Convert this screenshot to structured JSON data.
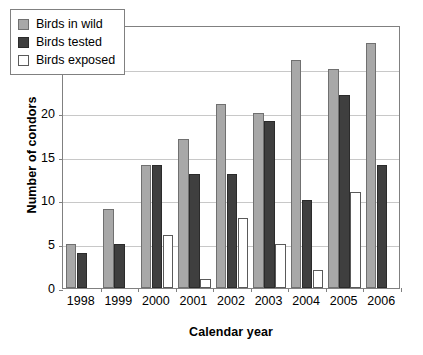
{
  "chart_data": {
    "type": "bar",
    "title": "",
    "xlabel": "Calendar year",
    "ylabel": "Number of condors",
    "categories": [
      "1998",
      "1999",
      "2000",
      "2001",
      "2002",
      "2003",
      "2004",
      "2005",
      "2006"
    ],
    "series": [
      {
        "name": "Birds in wild",
        "color": "#a8a8a8",
        "values": [
          5,
          9,
          14,
          17,
          21,
          20,
          26,
          25,
          28
        ]
      },
      {
        "name": "Birds tested",
        "color": "#3f3f3f",
        "values": [
          4,
          5,
          14,
          13,
          13,
          19,
          10,
          22,
          14
        ]
      },
      {
        "name": "Birds exposed",
        "color": "#ffffff",
        "values": [
          0,
          0,
          6,
          1,
          8,
          5,
          2,
          11,
          0
        ]
      }
    ],
    "ylim": [
      0,
      30
    ],
    "yticks": [
      0,
      5,
      10,
      15,
      20,
      25,
      30
    ],
    "ytick_labels": [
      "0",
      "5",
      "10",
      "15",
      "20",
      "25",
      "30"
    ],
    "grid": true,
    "legend_position": "top-left"
  }
}
